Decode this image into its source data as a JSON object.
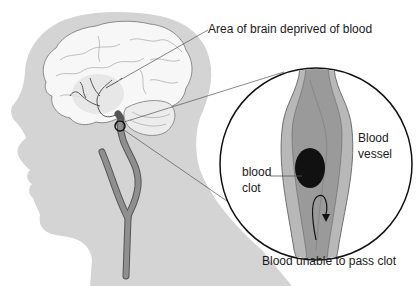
{
  "diagram": {
    "type": "medical illustration",
    "colors": {
      "head_silhouette": "#d4d4d4",
      "brain_fill": "#f7f7f7",
      "brain_outline": "#8a8a8a",
      "artery": "#8f8f8f",
      "artery_outline": "#555555",
      "vessel_outer": "#b8b8b8",
      "vessel_inner": "#9a9a9a",
      "clot": "#111111",
      "outline": "#111111"
    }
  },
  "labels": {
    "brain_area": "Area of brain deprived of blood",
    "vessel_line1": "Blood",
    "vessel_line2": "vessel",
    "clot_line1": "blood",
    "clot_line2": "clot",
    "flow": "Blood unable to pass clot"
  }
}
